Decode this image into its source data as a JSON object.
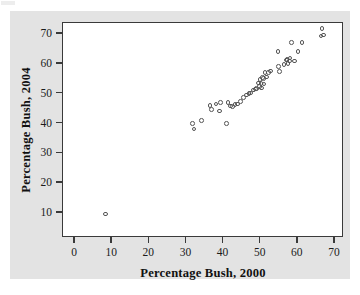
{
  "figure": {
    "background_color": "#e3e3e3",
    "plot_background_color": "#ffffff",
    "frame_color": "#3a3a3a",
    "marker_color": "#555555"
  },
  "chart_data": {
    "type": "scatter",
    "title": "",
    "xlabel": "Percentage Bush, 2000",
    "ylabel": "Percentage Bush, 2004",
    "xlim": [
      -2,
      73
    ],
    "ylim": [
      0,
      76
    ],
    "xticks": [
      0,
      10,
      20,
      30,
      40,
      50,
      60,
      70
    ],
    "yticks": [
      10,
      20,
      30,
      40,
      50,
      60,
      70
    ],
    "xtick_labels": [
      "0",
      "10",
      "20",
      "30",
      "40",
      "50",
      "60",
      "70"
    ],
    "ytick_labels": [
      "10",
      "20",
      "30",
      "40",
      "50",
      "60",
      "70"
    ],
    "grid": false,
    "legend": null,
    "marker": "open-circle",
    "points": [
      [
        8.5,
        9.3
      ],
      [
        31.9,
        39.6
      ],
      [
        32.3,
        37.8
      ],
      [
        34.4,
        40.6
      ],
      [
        36.6,
        45.7
      ],
      [
        37.0,
        44.4
      ],
      [
        38.2,
        46.2
      ],
      [
        39.2,
        43.9
      ],
      [
        39.4,
        46.8
      ],
      [
        41.0,
        39.7
      ],
      [
        41.5,
        46.7
      ],
      [
        42.1,
        45.6
      ],
      [
        42.7,
        45.3
      ],
      [
        43.3,
        46.1
      ],
      [
        44.1,
        46.2
      ],
      [
        44.9,
        47.0
      ],
      [
        45.6,
        48.4
      ],
      [
        46.4,
        49.2
      ],
      [
        47.1,
        49.7
      ],
      [
        47.6,
        49.9
      ],
      [
        48.4,
        50.9
      ],
      [
        48.8,
        51.2
      ],
      [
        49.1,
        51.4
      ],
      [
        49.7,
        53.3
      ],
      [
        49.9,
        52.0
      ],
      [
        50.1,
        54.4
      ],
      [
        50.3,
        53.0
      ],
      [
        50.5,
        51.6
      ],
      [
        50.8,
        55.1
      ],
      [
        51.0,
        54.8
      ],
      [
        51.2,
        52.9
      ],
      [
        51.4,
        56.7
      ],
      [
        51.8,
        55.2
      ],
      [
        52.4,
        56.8
      ],
      [
        52.9,
        57.3
      ],
      [
        54.9,
        63.8
      ],
      [
        55.1,
        58.8
      ],
      [
        55.3,
        57.0
      ],
      [
        56.5,
        59.4
      ],
      [
        57.2,
        60.9
      ],
      [
        57.4,
        61.2
      ],
      [
        57.6,
        59.7
      ],
      [
        58.0,
        60.6
      ],
      [
        58.2,
        61.6
      ],
      [
        58.6,
        66.9
      ],
      [
        59.3,
        60.6
      ],
      [
        60.3,
        63.9
      ],
      [
        61.4,
        66.9
      ],
      [
        66.5,
        69.0
      ],
      [
        66.8,
        71.5
      ],
      [
        67.2,
        69.4
      ]
    ]
  },
  "axes_geometry": {
    "plot_left_px": 62,
    "plot_top_px": 22,
    "plot_width_px": 281,
    "plot_height_px": 215,
    "x_zero_px": 74,
    "x_unit_px": 3.714,
    "y_ten_px": 212,
    "y_unit_px": 2.983
  }
}
